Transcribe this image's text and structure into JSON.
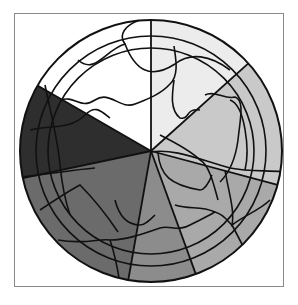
{
  "figure": {
    "center": [
      151,
      151
    ],
    "radius": 131,
    "frame_color": "#8a8a8a",
    "line_color": "#111111",
    "wedges": [
      {
        "name": "white",
        "start_deg": 210,
        "end_deg": 270,
        "color": "#ffffff"
      },
      {
        "name": "very-light-gray",
        "start_deg": 270,
        "end_deg": 318,
        "color": "#ececec"
      },
      {
        "name": "light-gray",
        "start_deg": 318,
        "end_deg": 375,
        "color": "#c9c9c9"
      },
      {
        "name": "mid-light-gray",
        "start_deg": 15,
        "end_deg": 70,
        "color": "#a9a9a9"
      },
      {
        "name": "mid-gray",
        "start_deg": 70,
        "end_deg": 100,
        "color": "#8c8c8c"
      },
      {
        "name": "gray",
        "start_deg": 100,
        "end_deg": 168,
        "color": "#6b6b6b"
      },
      {
        "name": "dark-gray",
        "start_deg": 168,
        "end_deg": 210,
        "color": "#2e2e2e"
      }
    ]
  }
}
